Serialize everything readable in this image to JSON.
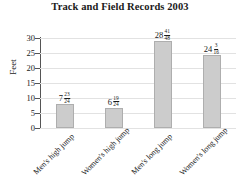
{
  "chart_data": {
    "type": "bar",
    "title": "Track and Field Records 2003",
    "xlabel": "",
    "ylabel": "Feet",
    "ylim": [
      0,
      30
    ],
    "yticks": [
      0,
      5,
      10,
      15,
      20,
      25,
      30
    ],
    "grid": true,
    "legend": "none",
    "categories": [
      "Men's high jump",
      "Women's high jump",
      "Men's long jump",
      "Women's long jump"
    ],
    "values": [
      7.9583,
      6.7917,
      28.8542,
      24.1875
    ],
    "data_labels": [
      {
        "whole": "7",
        "numerator": "23",
        "denominator": "24"
      },
      {
        "whole": "6",
        "numerator": "19",
        "denominator": "24"
      },
      {
        "whole": "28",
        "numerator": "41",
        "denominator": "48"
      },
      {
        "whole": "24",
        "numerator": "3",
        "denominator": "16"
      }
    ],
    "colors": {
      "bar_fill": "#cccccc",
      "bar_edge": "#aeaeae",
      "axis": "#555555",
      "grid": "#e2e2e2",
      "text": "#1a1a1a",
      "background": "#ffffff"
    }
  }
}
